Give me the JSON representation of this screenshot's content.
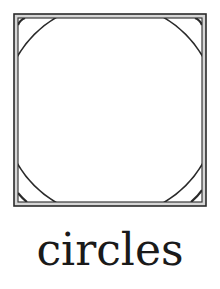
{
  "figure": {
    "type": "square-frame-with-circle",
    "stroke_color": "#2a2a2a",
    "frame_fill": "#d6d6d6",
    "background": "#ffffff",
    "outer_square": {
      "x": 14,
      "y": 14,
      "size": 192
    },
    "inner_square": {
      "x": 18,
      "y": 18,
      "size": 184
    },
    "circle": {
      "cx": 110,
      "cy": 110,
      "r": 107
    }
  },
  "caption": {
    "text": "circles"
  }
}
